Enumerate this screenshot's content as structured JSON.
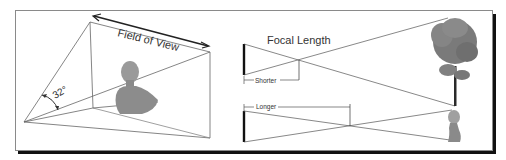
{
  "figure": {
    "left_panel": {
      "title": "Field of View",
      "angle_label": "32°"
    },
    "right_panel": {
      "title": "Focal Length",
      "shorter_label": "Shorter",
      "longer_label": "Longer"
    },
    "colors": {
      "line": "#555555",
      "frame_border": "#8a8a8a",
      "shadow": "#111111",
      "bust": "#8f8f8f",
      "tree_foliage": "#7a7a7a",
      "tree_trunk": "#2a2a2a"
    }
  }
}
